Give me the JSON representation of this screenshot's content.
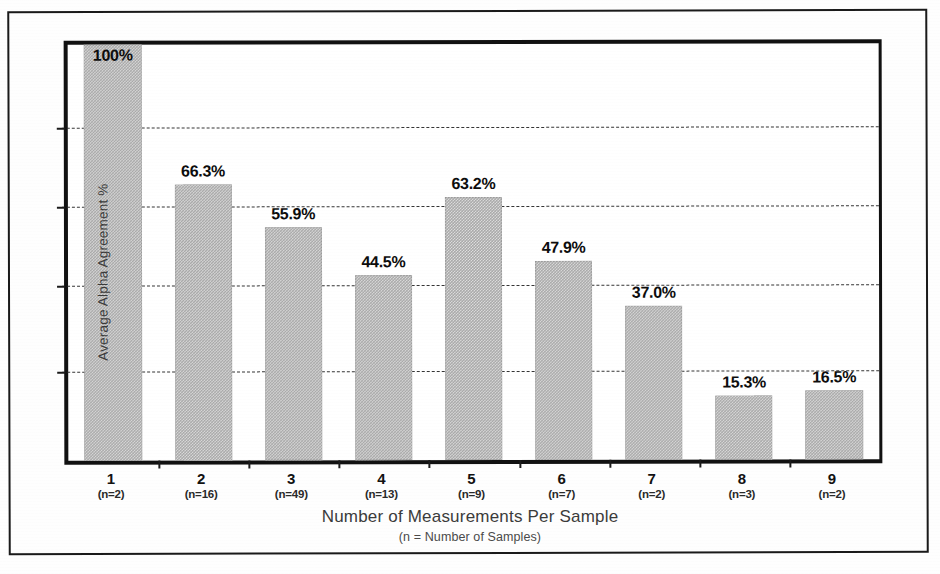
{
  "chart_data": {
    "type": "bar",
    "title": "",
    "xlabel": "Number of Measurements Per Sample",
    "xlabel_sub": "(n = Number of Samples)",
    "ylabel": "Average Alpha Agreement %",
    "categories": [
      "1",
      "2",
      "3",
      "4",
      "5",
      "6",
      "7",
      "8",
      "9"
    ],
    "category_sublabels": [
      "(n=2)",
      "(n=16)",
      "(n=49)",
      "(n=13)",
      "(n=9)",
      "(n=7)",
      "(n=2)",
      "(n=3)",
      "(n=2)"
    ],
    "values": [
      100,
      66.3,
      55.9,
      44.5,
      63.2,
      47.9,
      37.0,
      15.3,
      16.5
    ],
    "value_labels": [
      "100%",
      "66.3%",
      "55.9%",
      "44.5%",
      "63.2%",
      "47.9%",
      "37.0%",
      "15.3%",
      "16.5%"
    ],
    "ylim": [
      0,
      100
    ],
    "grid": true,
    "gridline_values": [
      80,
      61,
      42,
      21.5
    ],
    "legend": "none",
    "legend_position": "none",
    "bar_color": "#a9a9a9",
    "axis_color": "#111111",
    "gridline_color": "#2b2b2b",
    "label_color": "#0d0d0d"
  },
  "figure": {
    "background": "#ffffff",
    "frame_color": "#1a1a1a"
  }
}
